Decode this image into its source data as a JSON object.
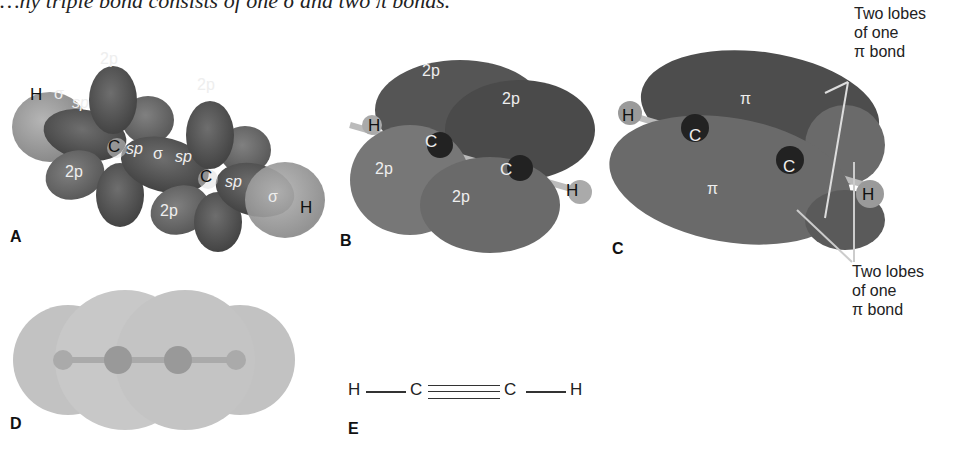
{
  "caption_fragment": "…ny triple bond consists of one σ and two π bonds.",
  "panels": {
    "A": {
      "label": "A",
      "atoms": {
        "h_left": "H",
        "c_left": "C",
        "c_right": "C",
        "h_right": "H"
      },
      "orbitals": {
        "sigma": "σ",
        "sp": "sp",
        "p2": "2p"
      }
    },
    "B": {
      "label": "B",
      "atoms": {
        "h_left": "H",
        "c_left": "C",
        "c_right": "C",
        "h_right": "H"
      },
      "orbitals": {
        "p2": "2p"
      }
    },
    "C": {
      "label": "C",
      "atoms": {
        "h_left": "H",
        "c_left": "C",
        "c_right": "C",
        "h_right": "H"
      },
      "orbitals": {
        "pi": "π"
      },
      "callout_top": [
        "Two lobes",
        "of one",
        "π bond"
      ],
      "callout_bottom": [
        "Two lobes",
        "of one",
        "π bond"
      ]
    },
    "D": {
      "label": "D"
    },
    "E": {
      "label": "E",
      "structure": {
        "h1": "H",
        "c1": "C",
        "c2": "C",
        "h2": "H"
      }
    }
  },
  "colors": {
    "lobe_dark": "#4a4a4a",
    "lobe_mid": "#6a6a6a",
    "hydrogen": "#9a9a9a",
    "space_fill": "#c4c4c4",
    "text": "#222222"
  }
}
